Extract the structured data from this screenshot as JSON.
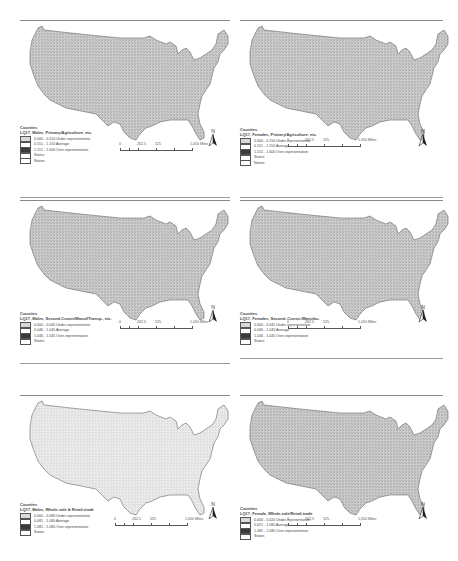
{
  "figure": {
    "panels": [
      {
        "id": "males-primary",
        "legend_header": "Counties",
        "legend_title": "LQ17, Males, Primary/Agriculture, etc.",
        "classes": [
          {
            "label": "0.000 - 0.150 Under-representation",
            "color": "#d9d9d9"
          },
          {
            "label": "0.151 - 1.150 Average",
            "color": "#ffffff"
          },
          {
            "label": "1.151 - 1.600 Over-representation",
            "color": "#3a3a3a"
          }
        ],
        "extra_legend": [
          "States",
          "Nation"
        ],
        "scale_labels": [
          "0",
          "262.5",
          "525",
          "1,050 Miles"
        ],
        "north_label": "N"
      },
      {
        "id": "females-primary",
        "legend_header": "Counties",
        "legend_title": "LQ17, Females, Primary/Agriculture, etc.",
        "classes": [
          {
            "label": "0.000 - 0.150 Under-representation",
            "color": "#d9d9d9"
          },
          {
            "label": "0.151 - 1.150 Average",
            "color": "#ffffff"
          },
          {
            "label": "1.151 - 1.600 Over-representation",
            "color": "#3a3a3a"
          }
        ],
        "extra_legend": [
          "States",
          "Nation"
        ],
        "scale_labels": [
          "0",
          "262.5",
          "525",
          "1,050 Miles"
        ],
        "north_label": "N"
      },
      {
        "id": "males-second",
        "legend_header": "Counties",
        "legend_title": "LQ17, Males, Second-Constr/Manuf/Transp., etc.",
        "classes": [
          {
            "label": "0.000 - 0.045 Under-representation",
            "color": "#d9d9d9"
          },
          {
            "label": "0.046 - 1.045 Average",
            "color": "#ffffff"
          },
          {
            "label": "1.046 - 1.045 Over-representation",
            "color": "#3a3a3a"
          }
        ],
        "extra_legend": [
          "States"
        ],
        "scale_labels": [
          "0",
          "262.5",
          "525",
          "1,050 Miles"
        ],
        "north_label": "N"
      },
      {
        "id": "females-second",
        "legend_header": "Counties",
        "legend_title": "LQ17, Females, Second.-Constr./Manufac.",
        "classes": [
          {
            "label": "0.000 - 0.045 Under-representation",
            "color": "#d9d9d9"
          },
          {
            "label": "0.046 - 1.045 Average",
            "color": "#ffffff"
          },
          {
            "label": "1.046 - 1.045 Over-representation",
            "color": "#3a3a3a"
          }
        ],
        "extra_legend": [
          "States"
        ],
        "scale_labels": [
          "0",
          "262.5",
          "525",
          "1,050 Miles"
        ],
        "north_label": "N"
      },
      {
        "id": "males-wholesale",
        "legend_header": "Counties",
        "legend_title": "LQ17, Males, Whole-sale & Retail-trade",
        "classes": [
          {
            "label": "0.000 - 0.080 Under-representation",
            "color": "#d9d9d9"
          },
          {
            "label": "0.081 - 1.080 Average",
            "color": "#ffffff"
          },
          {
            "label": "1.081 - 1.080 Over-representation",
            "color": "#3a3a3a"
          }
        ],
        "extra_legend": [
          "States"
        ],
        "scale_labels": [
          "0",
          "262.5",
          "525",
          "1,050 Miles"
        ],
        "north_label": "N"
      },
      {
        "id": "females-wholesale",
        "legend_header": "Counties",
        "legend_title": "LQ17, Female, Whole-sale/Retail-trade",
        "classes": [
          {
            "label": "0.000 - 0.020 Under-representation",
            "color": "#d9d9d9"
          },
          {
            "label": "0.021 - 1.080 Average",
            "color": "#ffffff"
          },
          {
            "label": "1.081 - 1.080 Over-representation",
            "color": "#3a3a3a"
          }
        ],
        "extra_legend": [
          "States"
        ],
        "scale_labels": [
          "0",
          "262.5",
          "525-",
          "1,050 Miles"
        ],
        "north_label": "N"
      }
    ]
  }
}
